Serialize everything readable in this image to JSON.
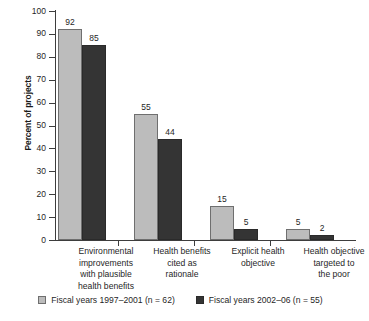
{
  "chart_data": {
    "type": "bar",
    "title": "",
    "subtitle": "",
    "xlabel": "",
    "ylabel": "Percent of projects",
    "ylim": [
      0,
      100
    ],
    "yticks": [
      0,
      10,
      20,
      30,
      40,
      50,
      60,
      70,
      80,
      90,
      100
    ],
    "ytick_labels": [
      "0",
      "10",
      "20",
      "30",
      "40",
      "50",
      "60",
      "70",
      "80",
      "90",
      "100"
    ],
    "grid": false,
    "legend_position": "bottom-center",
    "categories": [
      "Environmental improvements with plausible health benefits",
      "Health benefits cited as rationale",
      "Explicit health objective",
      "Health objective targeted to the poor"
    ],
    "category_label_lines": [
      [
        "Environmental",
        "improvements",
        "with plausible",
        "health benefits"
      ],
      [
        "Health benefits",
        "cited as",
        "rationale"
      ],
      [
        "Explicit health",
        "objective"
      ],
      [
        "Health objective",
        "targeted to",
        "the poor"
      ]
    ],
    "series": [
      {
        "name": "Fiscal years 1997–2001 (n = 62)",
        "color": "#bcbcbc",
        "values": [
          92,
          55,
          15,
          5
        ],
        "value_labels": [
          "92",
          "55",
          "15",
          "5"
        ]
      },
      {
        "name": "Fiscal years 2002–06 (n = 55)",
        "color": "#343434",
        "values": [
          85,
          44,
          5,
          2
        ],
        "value_labels": [
          "85",
          "44",
          "5",
          "2"
        ]
      }
    ]
  },
  "legend": {
    "items": [
      {
        "label": "Fiscal years 1997–2001 (n = 62)",
        "swatch": "light-gray-swatch"
      },
      {
        "label": "Fiscal years 2002–06 (n = 55)",
        "swatch": "dark-gray-swatch"
      }
    ]
  },
  "axes": {
    "y_title": "Percent of projects"
  }
}
